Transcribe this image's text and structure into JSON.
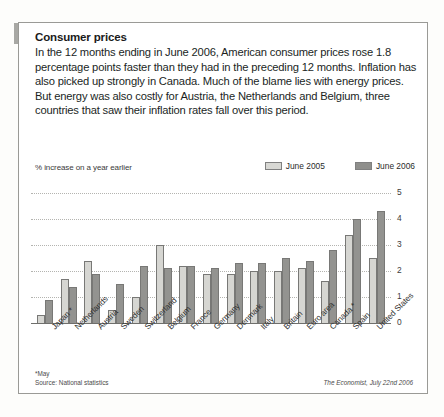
{
  "article": {
    "headline": "Consumer prices",
    "standfirst": "In the 12 months ending in June 2006, American consumer prices rose 1.8 percentage points faster than they had in the preceding 12 months. Inflation has also picked up strongly in Canada. Much of the blame lies with energy prices. But energy was also costly for Austria, the Netherlands and Belgium, three countries that saw their inflation rates fall over this period."
  },
  "footnote": {
    "asterisk": "*May",
    "source": "Source: National statistics"
  },
  "credit": "The Economist, July 22nd 2006",
  "colors": {
    "series_2005": "#d6d6d2",
    "series_2006": "#939390",
    "frame": "#9a9a96",
    "accent_tab": "#a8a8a4"
  },
  "chart_data": {
    "type": "bar",
    "title": "Consumer prices",
    "subtitle": "% increase on a year earlier",
    "xlabel": "",
    "ylabel": "% increase on a year earlier",
    "ylim": [
      0,
      5
    ],
    "yticks": [
      0,
      1,
      2,
      3,
      4,
      5
    ],
    "grid": true,
    "legend_position": "top-right",
    "categories": [
      "Japan *",
      "Netherlands",
      "Austria",
      "Sweden",
      "Switzerland",
      "Belgium",
      "France",
      "Germany",
      "Denmark",
      "Italy",
      "Britain",
      "Euro area",
      "Canada *",
      "Spain",
      "United States"
    ],
    "series": [
      {
        "name": "June 2005",
        "color": "#d6d6d2",
        "values": [
          0.3,
          1.7,
          2.4,
          0.5,
          1.0,
          3.0,
          2.2,
          1.9,
          1.9,
          2.0,
          2.0,
          2.1,
          1.6,
          3.4,
          2.5
        ]
      },
      {
        "name": "June 2006",
        "color": "#939390",
        "values": [
          0.9,
          1.4,
          1.9,
          1.5,
          2.2,
          2.1,
          2.2,
          2.1,
          2.3,
          2.3,
          2.5,
          2.4,
          2.8,
          4.0,
          4.3
        ]
      }
    ]
  }
}
